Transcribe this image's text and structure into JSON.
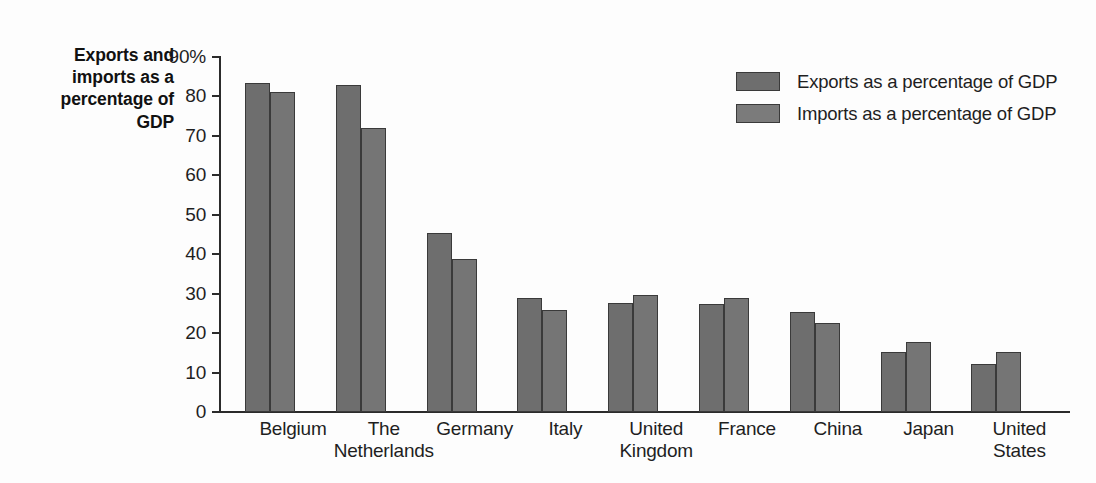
{
  "chart_data": {
    "type": "bar",
    "title": "",
    "ylabel": "Exports and imports as a percentage of GDP",
    "xlabel": "",
    "ylim": [
      0,
      90
    ],
    "ytick_labels": [
      "90%",
      "80",
      "70",
      "60",
      "50",
      "40",
      "30",
      "20",
      "10",
      "0"
    ],
    "ytick_values": [
      90,
      80,
      70,
      60,
      50,
      40,
      30,
      20,
      10,
      0
    ],
    "grid": false,
    "legend_position": "top-right",
    "categories": [
      "Belgium",
      "The\nNetherlands",
      "Germany",
      "Italy",
      "United\nKingdom",
      "France",
      "China",
      "Japan",
      "United\nStates"
    ],
    "series": [
      {
        "name": "Exports as a percentage of GDP",
        "color": "#6e6e6e",
        "values": [
          83.3,
          82.9,
          45.4,
          29.0,
          27.7,
          27.5,
          25.3,
          15.1,
          12.2
        ]
      },
      {
        "name": "Imports as a percentage of GDP",
        "color": "#757575",
        "values": [
          81.1,
          72.1,
          38.9,
          25.8,
          29.6,
          28.9,
          22.6,
          17.7,
          15.2
        ]
      }
    ]
  },
  "legend": {
    "items": [
      {
        "label": "Exports as a percentage of GDP",
        "swatch": "exports"
      },
      {
        "label": "Imports as a percentage of GDP",
        "swatch": "imports"
      }
    ]
  },
  "axis": {
    "y_title": "Exports and\nimports as a\npercentage of\nGDP"
  }
}
